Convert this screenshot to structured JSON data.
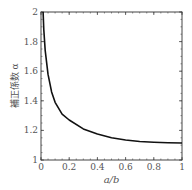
{
  "chart_data": {
    "type": "line",
    "title": "",
    "xlabel": "a/b",
    "ylabel": "補正係数 α",
    "xlim": [
      0,
      1
    ],
    "ylim": [
      1,
      2
    ],
    "x_ticks": [
      "0",
      "0.2",
      "0.4",
      "0.6",
      "0.8",
      "1"
    ],
    "y_ticks": [
      "1",
      "1.2",
      "1.4",
      "1.6",
      "1.8",
      "2"
    ],
    "grid": false,
    "legend": null,
    "series": [
      {
        "name": "α",
        "x": [
          0.015,
          0.02,
          0.03,
          0.05,
          0.075,
          0.1,
          0.15,
          0.2,
          0.3,
          0.4,
          0.5,
          0.6,
          0.7,
          0.8,
          0.9,
          1.0
        ],
        "y": [
          2.0,
          1.88,
          1.74,
          1.58,
          1.46,
          1.39,
          1.31,
          1.27,
          1.21,
          1.175,
          1.15,
          1.135,
          1.125,
          1.12,
          1.117,
          1.115
        ]
      }
    ]
  }
}
